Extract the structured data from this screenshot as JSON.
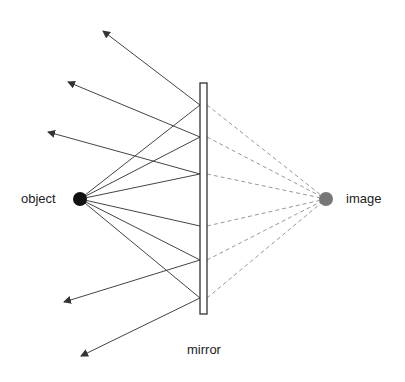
{
  "diagram": {
    "type": "plane-mirror-ray-diagram",
    "labels": {
      "object": "object",
      "image": "image",
      "mirror": "mirror"
    },
    "colors": {
      "object": "#111111",
      "image": "#777777",
      "incident_rays": "#444444",
      "reflected_rays": "#444444",
      "virtual_rays": "#999999",
      "mirror_outline": "#333333"
    },
    "object_point": {
      "x": 80,
      "y": 199,
      "r": 7
    },
    "image_point": {
      "x": 326,
      "y": 199,
      "r": 7
    },
    "mirror": {
      "x": 200,
      "y": 83,
      "width": 7,
      "height": 231
    },
    "reflection_points_y": [
      105,
      137,
      174,
      226,
      260,
      298
    ],
    "reflected_ray_tips": [
      {
        "x": 103,
        "y": 31
      },
      {
        "x": 68,
        "y": 82
      },
      {
        "x": 48,
        "y": 132
      },
      {
        "x": 64,
        "y": 302
      },
      {
        "x": 81,
        "y": 356
      }
    ]
  }
}
